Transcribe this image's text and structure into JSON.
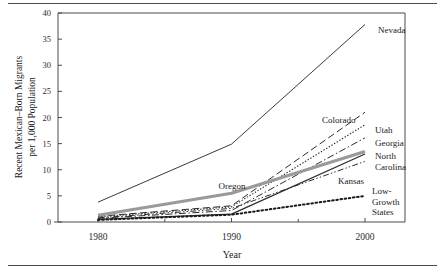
{
  "figure": {
    "has_top_rule": true,
    "has_bottom_rule": true,
    "frame_color": "#4a4a4a",
    "background": "#ffffff"
  },
  "chart_data": {
    "type": "line",
    "title": "",
    "xlabel": "Year",
    "ylabel_line1": "Recent Mexican–Born Migrants",
    "ylabel_line2": "per 1,000 Population",
    "x": [
      1980,
      1990,
      2000
    ],
    "xlim": [
      1977,
      2003
    ],
    "ylim": [
      0,
      40
    ],
    "xticks": [
      1980,
      1990,
      2000
    ],
    "xticklabels": [
      "1980",
      "1990",
      "2000"
    ],
    "xminorticks": [
      1985,
      1995
    ],
    "yticks": [
      0,
      5,
      10,
      15,
      20,
      25,
      30,
      35,
      40
    ],
    "yticklabels": [
      "0",
      "5",
      "10",
      "15",
      "20",
      "25",
      "30",
      "35",
      "40"
    ],
    "grid": false,
    "legend": "inline-labels-right",
    "series": [
      {
        "name": "Nevada",
        "values": [
          3.8,
          14.9,
          37.8
        ],
        "style": "solid",
        "color": "#3a3a3a",
        "width": 1.0,
        "label_x": 378,
        "label_y": 33,
        "label_anchor": "start"
      },
      {
        "name": "Colorado",
        "values": [
          1.1,
          3.1,
          21.0
        ],
        "style": "dashed",
        "color": "#2b2b2b",
        "width": 1.0,
        "label_x": 322,
        "label_y": 123,
        "label_anchor": "start"
      },
      {
        "name": "Utah",
        "values": [
          1.0,
          2.9,
          18.6
        ],
        "style": "fine-dotted",
        "color": "#2b2b2b",
        "width": 1.1,
        "label_x": 375,
        "label_y": 133,
        "label_anchor": "start"
      },
      {
        "name": "Georgia",
        "values": [
          0.7,
          2.2,
          16.1
        ],
        "style": "dash-dot",
        "color": "#2b2b2b",
        "width": 1.0,
        "label_x": 375,
        "label_y": 146,
        "label_anchor": "start"
      },
      {
        "name": "Oregon",
        "values": [
          1.3,
          5.5,
          13.5
        ],
        "style": "thick-gray",
        "color": "#9a9a9a",
        "width": 3.2,
        "label_x": 232,
        "label_y": 189,
        "label_anchor": "middle"
      },
      {
        "name": "North Carolina",
        "values": [
          0.5,
          1.5,
          13.0
        ],
        "style": "solid",
        "color": "#2b2b2b",
        "width": 1.2,
        "label_x": 375,
        "label_y": 159,
        "label_anchor": "start",
        "label_line2": "Carolina"
      },
      {
        "name": "Kansas",
        "values": [
          0.8,
          2.6,
          11.6
        ],
        "style": "dash-dot-dot",
        "color": "#2b2b2b",
        "width": 1.0,
        "label_x": 338,
        "label_y": 184,
        "label_anchor": "start"
      },
      {
        "name": "Low-Growth States",
        "values": [
          0.4,
          1.4,
          5.0
        ],
        "style": "bold-dotted",
        "color": "#1a1a1a",
        "width": 2.0,
        "label_x": 372,
        "label_y": 194,
        "label_anchor": "start",
        "label_line1": "Low-",
        "label_line2": "Growth",
        "label_line3": "States"
      }
    ]
  }
}
